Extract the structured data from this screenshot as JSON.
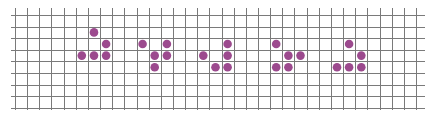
{
  "diagram": {
    "type": "life-grid",
    "colors": {
      "background": "#ffffff",
      "grid_line": "#7a7a7a",
      "dot": "#9c4a8e"
    },
    "grid": {
      "origin_x": 15,
      "origin_y": 15,
      "col_spacing": 12.15,
      "row_spacing": 11.6,
      "vertical_lines": 34,
      "horizontal_lines": 9,
      "vline_top": 8,
      "vline_bottom": 110,
      "hline_left": 11,
      "hline_right": 425,
      "dot_radius": 4.3
    },
    "generations": [
      {
        "label": "generation-1",
        "cells": [
          [
            6,
            1
          ],
          [
            7,
            2
          ],
          [
            5,
            3
          ],
          [
            6,
            3
          ],
          [
            7,
            3
          ]
        ]
      },
      {
        "label": "generation-2",
        "cells": [
          [
            10,
            2
          ],
          [
            12,
            2
          ],
          [
            11,
            3
          ],
          [
            12,
            3
          ],
          [
            11,
            4
          ]
        ]
      },
      {
        "label": "generation-3",
        "cells": [
          [
            17,
            2
          ],
          [
            15,
            3
          ],
          [
            17,
            3
          ],
          [
            16,
            4
          ],
          [
            17,
            4
          ]
        ]
      },
      {
        "label": "generation-4",
        "cells": [
          [
            21,
            2
          ],
          [
            22,
            3
          ],
          [
            23,
            3
          ],
          [
            21,
            4
          ],
          [
            22,
            4
          ]
        ]
      },
      {
        "label": "generation-5",
        "cells": [
          [
            27,
            2
          ],
          [
            28,
            3
          ],
          [
            26,
            4
          ],
          [
            27,
            4
          ],
          [
            28,
            4
          ]
        ]
      }
    ]
  }
}
